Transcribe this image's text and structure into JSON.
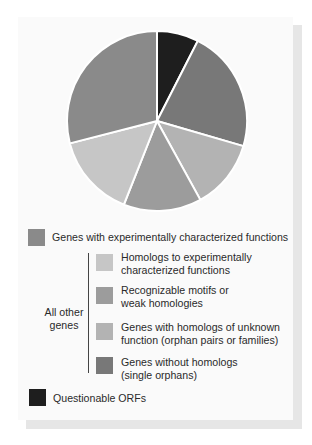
{
  "chart_data": {
    "type": "pie",
    "title": "",
    "start_angle_deg": 0,
    "direction": "clockwise",
    "slices": [
      {
        "label": "Questionable ORFs",
        "value": 7.5,
        "color": "#1e1e1e"
      },
      {
        "label": "Genes without homologs (single orphans)",
        "value": 22,
        "color": "#787878"
      },
      {
        "label": "Genes with homologs of unknown function (orphan pairs or families)",
        "value": 12.5,
        "color": "#b3b3b3"
      },
      {
        "label": "Recognizable motifs or weak homologies",
        "value": 14,
        "color": "#9c9c9c"
      },
      {
        "label": "Homologs to experimentally characterized functions",
        "value": 15,
        "color": "#c6c6c6"
      },
      {
        "label": "Genes with experimentally characterized functions",
        "value": 29,
        "color": "#8a8a8a"
      }
    ],
    "legend_position": "below"
  },
  "legend": {
    "experimental": {
      "label": "Genes with experimentally characterized functions",
      "color": "#8a8a8a"
    },
    "group_label_line1": "All other",
    "group_label_line2": "genes",
    "homologs": {
      "line1": "Homologs to experimentally",
      "line2": "characterized functions",
      "color": "#c6c6c6"
    },
    "motifs": {
      "line1": "Recognizable motifs or",
      "line2": "weak homologies",
      "color": "#9c9c9c"
    },
    "orphan_pairs": {
      "line1": "Genes with homologs of unknown",
      "line2": "function (orphan pairs or families)",
      "color": "#b3b3b3"
    },
    "single_orphans": {
      "line1": "Genes without homologs",
      "line2": "(single orphans)",
      "color": "#787878"
    },
    "questionable": {
      "label": "Questionable ORFs",
      "color": "#1e1e1e"
    }
  }
}
